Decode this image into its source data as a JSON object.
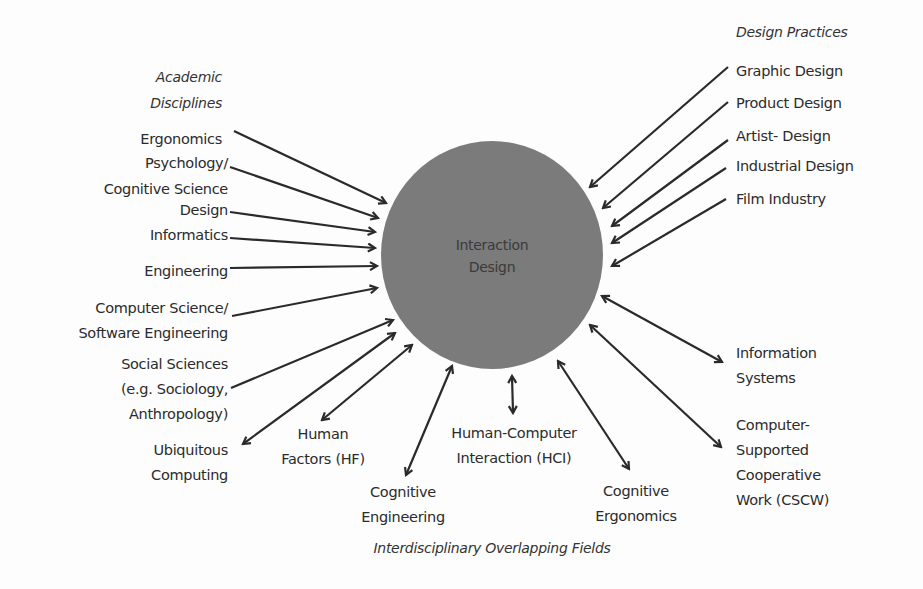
{
  "center": {
    "lines": [
      "Interaction",
      "Design"
    ],
    "fill": "#7b7b7b"
  },
  "groups": {
    "academic": {
      "heading": [
        "Academic",
        "Disciplines"
      ],
      "items": [
        {
          "lines": [
            "Ergonomics"
          ]
        },
        {
          "lines": [
            "Psychology/",
            "Cognitive Science"
          ]
        },
        {
          "lines": [
            "Design"
          ]
        },
        {
          "lines": [
            "Informatics"
          ]
        },
        {
          "lines": [
            "Engineering"
          ]
        },
        {
          "lines": [
            "Computer Science/",
            "Software Engineering"
          ]
        },
        {
          "lines": [
            "Social Sciences",
            "(e.g. Sociology,",
            "Anthropology)"
          ]
        },
        {
          "lines": [
            "Ubiquitous",
            "Computing"
          ]
        }
      ]
    },
    "design_practices": {
      "heading": [
        "Design Practices"
      ],
      "items": [
        {
          "lines": [
            "Graphic Design"
          ]
        },
        {
          "lines": [
            "Product Design"
          ]
        },
        {
          "lines": [
            "Artist- Design"
          ]
        },
        {
          "lines": [
            "Industrial Design"
          ]
        },
        {
          "lines": [
            "Film Industry"
          ]
        }
      ]
    },
    "interdisciplinary": {
      "heading": [
        "Interdisciplinary Overlapping Fields"
      ],
      "items": [
        {
          "lines": [
            "Human",
            "Factors (HF)"
          ]
        },
        {
          "lines": [
            "Cognitive",
            "Engineering"
          ]
        },
        {
          "lines": [
            "Human-Computer",
            "Interaction (HCI)"
          ]
        },
        {
          "lines": [
            "Cognitive",
            "Ergonomics"
          ]
        },
        {
          "lines": [
            "Information",
            "Systems"
          ]
        },
        {
          "lines": [
            "Computer-",
            "Supported",
            "Cooperative",
            "Work (CSCW)"
          ]
        }
      ]
    }
  },
  "colors": {
    "text": "#2b2b2b",
    "arrow": "#2a2a2a",
    "circle": "#7b7b7b",
    "background": "#fdfdfd"
  }
}
